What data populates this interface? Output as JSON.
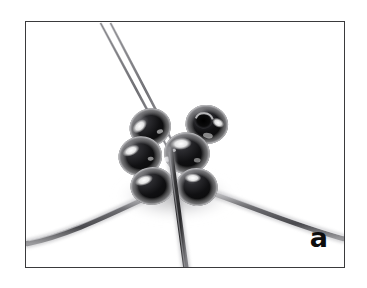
{
  "figure": {
    "kind": "photograph",
    "panel_label": "a",
    "colors": {
      "background": "#ffffff",
      "frame_border": "#3a3a3c",
      "bead_dark": "#121212",
      "bead_shadow": "#2a2a2a",
      "bead_highlight": "#ffffff",
      "bead_rim": "#9a9a9a",
      "wire_dark": "#3c3c3e",
      "wire_light": "#b8b8bb",
      "label_text": "#0d0d0d"
    },
    "frame": {
      "left": 25,
      "top": 21,
      "width": 320,
      "height": 247,
      "border_width": 1.5
    },
    "beads": [
      {
        "name": "bead-upper-left",
        "cx": 150,
        "cy": 127,
        "rx": 21,
        "ry": 19,
        "rot": -18,
        "highlight_cx": 144,
        "highlight_cy": 120,
        "hole": false
      },
      {
        "name": "bead-upper-right",
        "cx": 207,
        "cy": 124,
        "rx": 21,
        "ry": 19,
        "rot": 10,
        "highlight_cx": 215,
        "highlight_cy": 117,
        "hole": true
      },
      {
        "name": "bead-mid-left",
        "cx": 140,
        "cy": 155,
        "rx": 22,
        "ry": 20,
        "rot": -8,
        "highlight_cx": 133,
        "highlight_cy": 147,
        "hole": false
      },
      {
        "name": "bead-center",
        "cx": 186,
        "cy": 153,
        "rx": 23,
        "ry": 21,
        "rot": 6,
        "highlight_cx": 182,
        "highlight_cy": 142,
        "hole": false
      },
      {
        "name": "bead-lower-left",
        "cx": 152,
        "cy": 185,
        "rx": 22,
        "ry": 19,
        "rot": -5,
        "highlight_cx": 145,
        "highlight_cy": 177,
        "hole": false
      },
      {
        "name": "bead-lower-right",
        "cx": 196,
        "cy": 186,
        "rx": 21,
        "ry": 19,
        "rot": 8,
        "highlight_cx": 192,
        "highlight_cy": 178,
        "hole": false
      }
    ],
    "wires": [
      {
        "name": "wire-top-thin-a",
        "style": "thin-light",
        "path": "M 100 22 L 172 155"
      },
      {
        "name": "wire-top-thin-b",
        "style": "thin-light",
        "path": "M 109 22 L 178 155"
      },
      {
        "name": "wire-left-curve",
        "style": "thick-soft",
        "path": "M 26 243 C 70 234 118 208 160 190"
      },
      {
        "name": "wire-right-curve",
        "style": "thick-soft",
        "path": "M 202 189 C 250 206 296 226 344 238"
      },
      {
        "name": "wire-bottom-stem",
        "style": "thick-dark",
        "path": "M 174 160 L 186 268"
      }
    ]
  }
}
